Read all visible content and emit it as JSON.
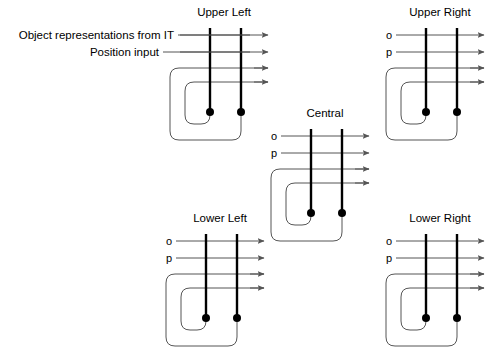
{
  "figure": {
    "background_color": "#ffffff",
    "line_color": "#555555",
    "column_color": "#000000",
    "width": 496,
    "height": 361
  },
  "global_labels": {
    "object_input": "Object representations from IT",
    "position_input": "Position input"
  },
  "modules": [
    {
      "id": "upper-left",
      "title": "Upper Left",
      "title_x": 224,
      "title_y": 16,
      "origin_x": 168,
      "origin_y": 28,
      "show_op_labels": false,
      "o_label": "o",
      "p_label": "p"
    },
    {
      "id": "upper-right",
      "title": "Upper Right",
      "title_x": 440,
      "title_y": 16,
      "origin_x": 384,
      "origin_y": 28,
      "show_op_labels": true,
      "o_label": "o",
      "p_label": "p"
    },
    {
      "id": "central",
      "title": "Central",
      "title_x": 325,
      "title_y": 117,
      "origin_x": 269,
      "origin_y": 129,
      "show_op_labels": true,
      "o_label": "o",
      "p_label": "p"
    },
    {
      "id": "lower-left",
      "title": "Lower Left",
      "title_x": 220,
      "title_y": 222,
      "origin_x": 164,
      "origin_y": 234,
      "show_op_labels": true,
      "o_label": "o",
      "p_label": "p"
    },
    {
      "id": "lower-right",
      "title": "Lower Right",
      "title_x": 440,
      "title_y": 222,
      "origin_x": 384,
      "origin_y": 234,
      "show_op_labels": true,
      "o_label": "o",
      "p_label": "p"
    }
  ],
  "input_leader_lines": [
    {
      "name": "object-leader",
      "x1": 178,
      "y1": 35,
      "x2": 250,
      "y2": 35
    },
    {
      "name": "position-leader",
      "x1": 163,
      "y1": 52,
      "x2": 250,
      "y2": 52
    }
  ],
  "label_positions": {
    "object_label_x": 174,
    "object_label_y": 39,
    "position_label_x": 159,
    "position_label_y": 56
  }
}
